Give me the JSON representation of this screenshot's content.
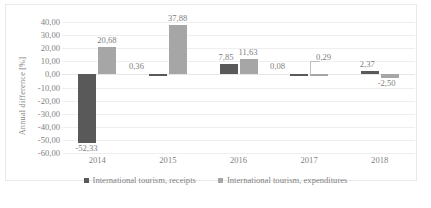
{
  "chart_data": {
    "type": "bar",
    "title": "",
    "xlabel": "",
    "ylabel": "Annual difference  [%]",
    "categories": [
      "2014",
      "2015",
      "2016",
      "2017",
      "2018"
    ],
    "ylim": [
      -60,
      40
    ],
    "ytick_labels": [
      "40,00",
      "30,00",
      "20,00",
      "10,00",
      "0,00",
      "-10,00",
      "-20,00",
      "-30,00",
      "-40,00",
      "-50,00",
      "-60,00"
    ],
    "ytick_values": [
      40,
      30,
      20,
      10,
      0,
      -10,
      -20,
      -30,
      -40,
      -50,
      -60
    ],
    "grid": true,
    "legend_position": "bottom",
    "series": [
      {
        "name": "International tourism, receipts",
        "color": "#595959",
        "values": [
          -52.33,
          0.36,
          7.85,
          0.08,
          2.37
        ],
        "labels": [
          "-52,33",
          "0,36",
          "7,85",
          "0,08",
          "2,37"
        ]
      },
      {
        "name": "International tourism, expenditures",
        "color": "#a6a6a6",
        "values": [
          20.68,
          37.88,
          11.63,
          0.29,
          -2.5
        ],
        "labels": [
          "20,68",
          "37,88",
          "11,63",
          "0,29",
          "-2,50"
        ]
      }
    ]
  },
  "legend": {
    "items": [
      {
        "label": "International tourism, receipts",
        "color": "#595959"
      },
      {
        "label": "International tourism, expenditures",
        "color": "#a6a6a6"
      }
    ]
  }
}
